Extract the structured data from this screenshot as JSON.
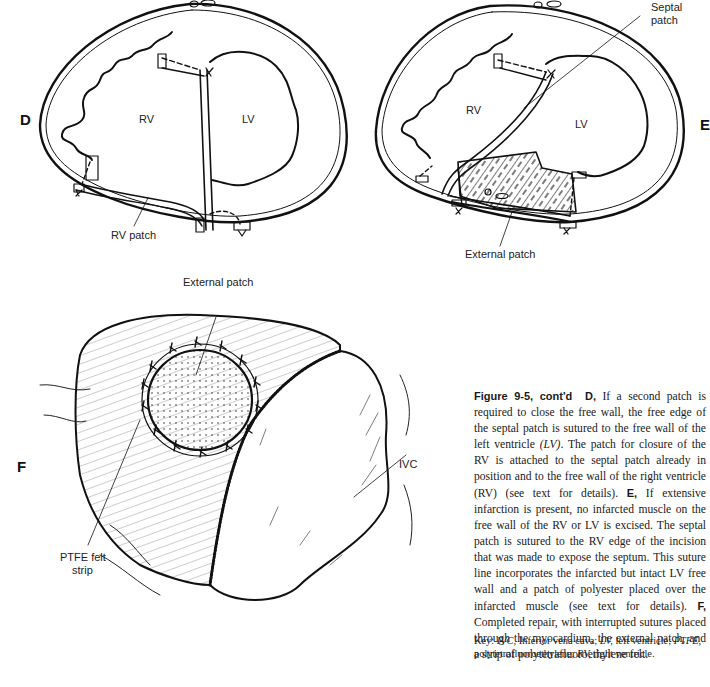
{
  "panels": {
    "D": {
      "letter": "D",
      "labels": {
        "rv": "RV",
        "lv": "LV",
        "rv_patch": "RV patch"
      }
    },
    "E": {
      "letter": "E",
      "labels": {
        "rv": "RV",
        "lv": "LV",
        "septal_patch_line1": "Septal",
        "septal_patch_line2": "patch",
        "external_patch": "External patch"
      }
    },
    "F": {
      "letter": "F",
      "labels": {
        "external_patch": "External patch",
        "ivc": "IVC",
        "ptfe_line1": "PTFE felt",
        "ptfe_line2": "strip"
      }
    }
  },
  "caption": {
    "figure_label": "Figure 9-5, cont'd",
    "d_letter": "D,",
    "d_text_1": " If a second patch is required to close the free wall, the free edge of the septal patch is sutured to the free wall of the left ventricle ",
    "d_abbr_lv": "(LV)",
    "d_text_2": ". The patch for closure of the RV is attached to the septal patch already in position and to the free wall of the right ventricle (RV) (see text for details). ",
    "e_letter": "E,",
    "e_text": " If extensive infarction is present, no infarcted muscle on the free wall of the RV or LV is excised. The septal patch is sutured to the RV edge of the incision that was made to expose the septum. This suture line incorporates the infarcted but intact LV free wall and a patch of polyester placed over the infarcted muscle (see text for details). ",
    "f_letter": "F,",
    "f_text": " Completed repair, with interrupted sutures placed through the myocardium, the external patch, and a strip of polytetrafluoroethylene felt."
  },
  "key": {
    "prefix": "Key: ",
    "ivc_abbr": "IVC,",
    "ivc_def": " Inferior vena cava; ",
    "lv_abbr": "LV,",
    "lv_def": " left ventricle; ",
    "ptfe_abbr": "PTFE,",
    "ptfe_def": " polytetrafluoroethylene; ",
    "rv_abbr": "RV,",
    "rv_def": " right ventricle."
  }
}
